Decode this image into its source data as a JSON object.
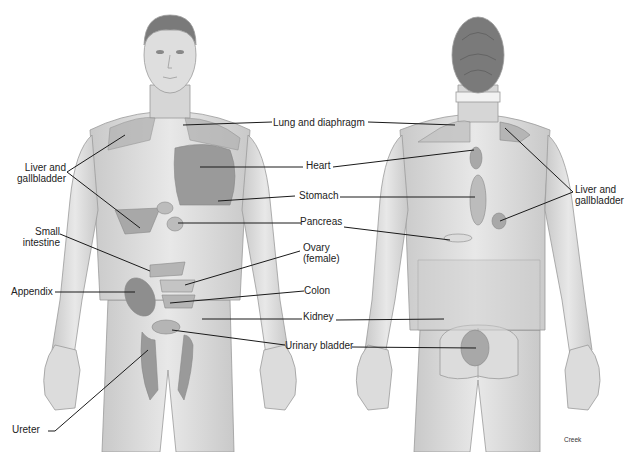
{
  "figure": {
    "credit": "Creek",
    "views": [
      "anterior",
      "posterior"
    ]
  },
  "labels": {
    "liver_front": "Liver and\ngallbladder",
    "small_intestine": "Small\nintestine",
    "appendix": "Appendix",
    "ureter": "Ureter",
    "lung": "Lung and diaphragm",
    "heart": "Heart",
    "stomach": "Stomach",
    "pancreas": "Pancreas",
    "ovary": "Ovary\n(female)",
    "colon": "Colon",
    "kidney": "Kidney",
    "bladder": "Urinary bladder",
    "liver_back": "Liver and\ngallbladder"
  },
  "colors": {
    "skin": "#e2e2e2",
    "skin_shadow": "#c4c4c4",
    "outline": "#9a9a9a",
    "hair": "#7a7a7a",
    "zone_light": "#b5b5b5",
    "zone_dark": "#8e8e8e",
    "leader_line": "#1a1a1a"
  }
}
